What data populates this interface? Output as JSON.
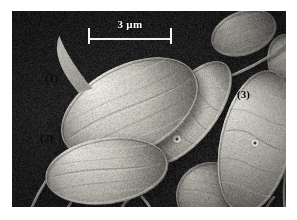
{
  "figure": {
    "kind": "sem-micrograph",
    "plate": {
      "left": 12,
      "top": 11,
      "width": 274,
      "height": 196,
      "background_color": "#1b1b1b",
      "page_background": "#ffffff"
    },
    "scale_bar": {
      "label": "3 µm",
      "length_value": 3,
      "length_unit": "µm",
      "bar_color": "#f2f2f2",
      "bar_px_left": 88,
      "bar_px_right": 171,
      "bar_px_length": 83,
      "tick_style": "end-caps"
    },
    "cell_labels": [
      {
        "id": "1",
        "text": "(1)",
        "x": 33,
        "y": 61,
        "color": "#0a0a0a"
      },
      {
        "id": "2",
        "text": "(2)",
        "x": 28,
        "y": 121,
        "color": "#0a0a0a"
      },
      {
        "id": "3",
        "text": "(3)",
        "x": 225,
        "y": 77,
        "color": "#0a0a0a"
      }
    ],
    "palette": {
      "background_dark": "#1b1b1b",
      "background_dark_2": "#242424",
      "cell_highlight": "#e8e6e0",
      "cell_midtone": "#bdbab2",
      "cell_shadow": "#6e6b66",
      "cell_deep_shadow": "#3a3835",
      "bead_bright": "#f6f5f2",
      "bead_core": "#2a2a28"
    },
    "scene": {
      "description": "Scanning electron micrograph of ovoid flagellated cells on a dark substrate",
      "cells": [
        {
          "name": "cell-1",
          "label": "(1)",
          "shape": "elongated-ovoid",
          "cx": 118,
          "cy": 98,
          "rx": 74,
          "ry": 44,
          "rotation_deg": -27,
          "has_apical_spine": true,
          "spine_note": "curved apical flagellum projecting up-left"
        },
        {
          "name": "cell-2",
          "label": "(2)",
          "shape": "ovoid",
          "cx": 95,
          "cy": 160,
          "rx": 62,
          "ry": 33,
          "rotation_deg": -8,
          "has_apical_spine": false
        },
        {
          "name": "cell-3",
          "label": "(3)",
          "shape": "elongated-ovoid",
          "cx": 244,
          "cy": 131,
          "rx": 36,
          "ry": 73,
          "rotation_deg": 12,
          "has_bead": true,
          "bead_x": 243,
          "bead_y": 132
        },
        {
          "name": "cell-center",
          "label": "",
          "shape": "slender-ovoid",
          "cx": 176,
          "cy": 102,
          "rx": 28,
          "ry": 62,
          "rotation_deg": 38,
          "has_bead": true,
          "bead_x": 165,
          "bead_y": 128
        },
        {
          "name": "cell-background-upper-right",
          "label": "",
          "shape": "partial-ovoid",
          "cx": 232,
          "cy": 22,
          "rx": 34,
          "ry": 22,
          "rotation_deg": -20,
          "has_bead": false
        },
        {
          "name": "cell-background-lower-right",
          "label": "",
          "shape": "partial-ovoid",
          "cx": 200,
          "cy": 185,
          "rx": 36,
          "ry": 34,
          "rotation_deg": 8,
          "has_bead": false
        },
        {
          "name": "cell-background-far-right",
          "label": "",
          "shape": "partial-ovoid",
          "cx": 285,
          "cy": 60,
          "rx": 26,
          "ry": 40,
          "rotation_deg": -28,
          "has_bead": false
        }
      ],
      "filaments": [
        {
          "name": "flagellum-lower-left-a",
          "from_x": 34,
          "from_y": 170,
          "to_x": 16,
          "to_y": 206
        },
        {
          "name": "flagellum-lower-left-b",
          "from_x": 62,
          "from_y": 182,
          "to_x": 44,
          "to_y": 207
        },
        {
          "name": "flagellum-lower-center",
          "from_x": 120,
          "from_y": 186,
          "to_x": 108,
          "to_y": 207
        },
        {
          "name": "flagellum-lower-center-b",
          "from_x": 130,
          "from_y": 186,
          "to_x": 140,
          "to_y": 207
        },
        {
          "name": "flagellum-right-a",
          "from_x": 262,
          "from_y": 186,
          "to_x": 250,
          "to_y": 207
        },
        {
          "name": "flagellum-right-b",
          "from_x": 275,
          "from_y": 150,
          "to_x": 274,
          "to_y": 207
        },
        {
          "name": "flagellum-upper-right",
          "from_x": 205,
          "from_y": 70,
          "to_x": 274,
          "to_y": 34
        }
      ]
    }
  }
}
